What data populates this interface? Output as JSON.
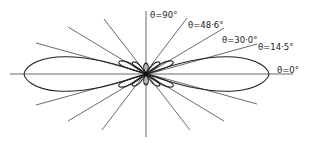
{
  "diagram": {
    "type": "polar-radiation-pattern",
    "center": [
      146,
      74
    ],
    "labels": [
      {
        "text": "θ=90°",
        "x": 150,
        "y": 18
      },
      {
        "text": "θ=48·6°",
        "x": 188,
        "y": 28
      },
      {
        "text": "θ=30·0°",
        "x": 222,
        "y": 43
      },
      {
        "text": "θ=14·5°",
        "x": 258,
        "y": 50
      },
      {
        "text": "θ=0°",
        "x": 277,
        "y": 73
      }
    ],
    "angles_deg": [
      0,
      14.5,
      30.0,
      48.6,
      90
    ],
    "colors": {
      "line": "#444444",
      "lobe": "#222222",
      "background": "#ffffff"
    }
  }
}
